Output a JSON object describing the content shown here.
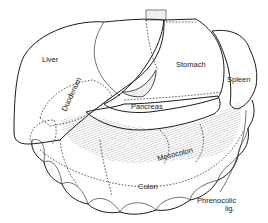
{
  "diagram": {
    "type": "anatomical-line-drawing",
    "colors": {
      "line": "#1a1a1a",
      "background": "#ffffff"
    },
    "labels": [
      {
        "id": "liver",
        "text": "Liver"
      },
      {
        "id": "stomach",
        "text": "Stomach"
      },
      {
        "id": "spleen",
        "text": "Spleen"
      },
      {
        "id": "duodenum",
        "text": "Duodenum"
      },
      {
        "id": "pancreas",
        "text": "Pancreas"
      },
      {
        "id": "mesocolon",
        "text": "Mesocolon"
      },
      {
        "id": "colon",
        "text": "Colon"
      },
      {
        "id": "phrenocolic_line1",
        "text": "Phrenocolic"
      },
      {
        "id": "phrenocolic_line2",
        "text": "lig."
      }
    ]
  }
}
